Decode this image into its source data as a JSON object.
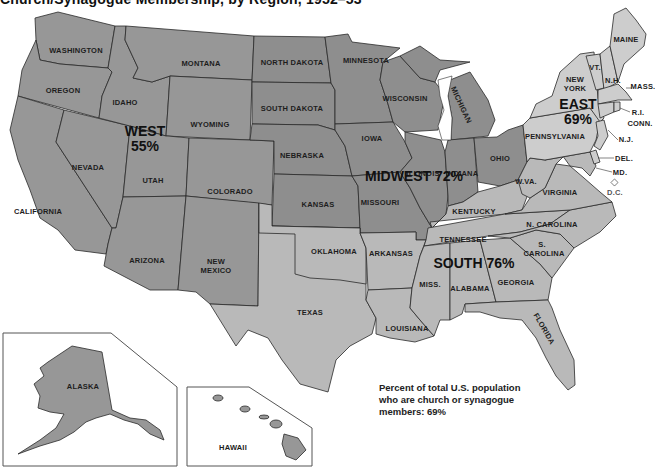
{
  "title": "Church/Synagogue Membership, by Region, 1952–53",
  "regions": {
    "west": {
      "name": "WEST",
      "pct": "55%",
      "fill": "#979797"
    },
    "midwest": {
      "name": "MIDWEST",
      "pct": "72%",
      "label": "MIDWEST 72%",
      "fill": "#8e8e8e"
    },
    "south": {
      "name": "SOUTH",
      "pct": "76%",
      "label": "SOUTH 76%",
      "fill": "#b9b9b9"
    },
    "east": {
      "name": "EAST",
      "pct": "69%",
      "fill": "#cdcdcd"
    }
  },
  "states": {
    "washington": "WASHINGTON",
    "oregon": "OREGON",
    "california": "CALIFORNIA",
    "nevada": "NEVADA",
    "idaho": "IDAHO",
    "montana": "MONTANA",
    "wyoming": "WYOMING",
    "utah": "UTAH",
    "colorado": "COLORADO",
    "arizona": "ARIZONA",
    "new_mexico_1": "NEW",
    "new_mexico_2": "MEXICO",
    "north_dakota": "NORTH DAKOTA",
    "south_dakota": "SOUTH DAKOTA",
    "nebraska": "NEBRASKA",
    "kansas": "KANSAS",
    "minnesota": "MINNESOTA",
    "iowa": "IOWA",
    "missouri": "MISSOURI",
    "wisconsin": "WISCONSIN",
    "illinois": "ILLINOIS",
    "michigan": "MICHIGAN",
    "indiana": "INDIANA",
    "ohio": "OHIO",
    "oklahoma": "OKLAHOMA",
    "texas": "TEXAS",
    "arkansas": "ARKANSAS",
    "louisiana": "LOUISIANA",
    "kentucky": "KENTUCKY",
    "tennessee": "TENNESSEE",
    "mississippi": "MISS.",
    "alabama": "ALABAMA",
    "georgia": "GEORGIA",
    "florida": "FLORIDA",
    "south_carolina_1": "S.",
    "south_carolina_2": "CAROLINA",
    "north_carolina": "N. CAROLINA",
    "virginia": "VIRGINIA",
    "west_virginia": "W.VA.",
    "pennsylvania": "PENNSYLVANIA",
    "new_york_1": "NEW",
    "new_york_2": "YORK",
    "vermont": "VT.",
    "new_hampshire": "N.H.",
    "maine": "MAINE",
    "massachusetts": "MASS.",
    "rhode_island": "R.I.",
    "connecticut": "CONN.",
    "new_jersey": "N.J.",
    "delaware": "DEL.",
    "maryland": "MD.",
    "dc": "D.C.",
    "alaska": "ALASKA",
    "hawaii": "HAWAII"
  },
  "note": {
    "line1": "Percent of total U.S. population",
    "line2": "who are church or synagogue",
    "line3": "members: 69%"
  }
}
